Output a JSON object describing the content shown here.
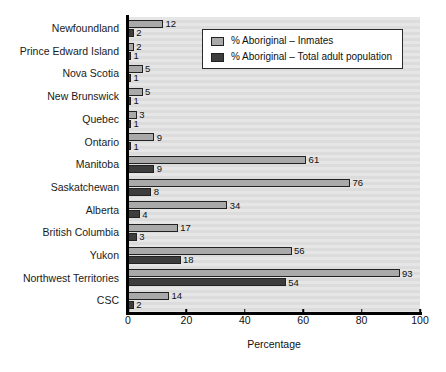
{
  "chart_data": {
    "type": "bar",
    "orientation": "horizontal",
    "title": "",
    "xlabel": "Percentage",
    "ylabel": "",
    "xlim": [
      0,
      100
    ],
    "xticks": [
      0,
      20,
      40,
      60,
      80,
      100
    ],
    "grid": false,
    "legend_position": "top-right-inside",
    "categories": [
      "Newfoundland",
      "Prince Edward Island",
      "Nova Scotia",
      "New Brunswick",
      "Quebec",
      "Ontario",
      "Manitoba",
      "Saskatchewan",
      "Alberta",
      "British Columbia",
      "Yukon",
      "Northwest Territories",
      "CSC"
    ],
    "series": [
      {
        "name": "% Aboriginal – Inmates",
        "color": "#a9a9a9",
        "values": [
          12,
          2,
          5,
          5,
          3,
          9,
          61,
          76,
          34,
          17,
          56,
          93,
          14
        ]
      },
      {
        "name": "% Aboriginal – Total adult population",
        "color": "#3d3d3d",
        "values": [
          2,
          1,
          1,
          1,
          1,
          1,
          9,
          8,
          4,
          3,
          18,
          54,
          2
        ]
      }
    ]
  },
  "legend": {
    "items": [
      {
        "label": "% Aboriginal – Inmates",
        "swatch": "light"
      },
      {
        "label": "% Aboriginal – Total adult population",
        "swatch": "dark"
      }
    ]
  },
  "axis": {
    "x_title": "Percentage",
    "x_tick_labels": [
      "0",
      "20",
      "40",
      "60",
      "80",
      "100"
    ]
  }
}
